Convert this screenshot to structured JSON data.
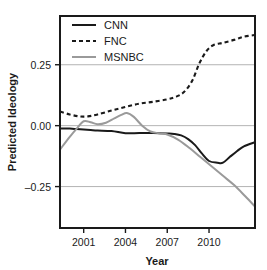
{
  "chart_data": {
    "type": "line",
    "title": "",
    "xlabel": "Year",
    "ylabel": "Predicted Ideology",
    "xlim": [
      1999.3,
      2013.3
    ],
    "ylim": [
      -0.42,
      0.45
    ],
    "xticks": [
      2001,
      2004,
      2007,
      2010
    ],
    "xtick_labels": [
      "2001",
      "2004",
      "2007",
      "2010"
    ],
    "yticks": [
      0.25,
      0.0,
      -0.25
    ],
    "ytick_labels": [
      "0.25",
      "0.00",
      "–0.25"
    ],
    "grid": "horizontal",
    "legend_position": "top-left",
    "series": [
      {
        "name": "CNN",
        "style": "solid",
        "color": "#1a1a1a",
        "x": [
          1999.3,
          2000.0,
          2000.5,
          2001.0,
          2001.5,
          2002.0,
          2003.0,
          2004.0,
          2005.0,
          2006.0,
          2007.0,
          2007.5,
          2008.0,
          2008.5,
          2009.0,
          2009.5,
          2010.0,
          2010.6,
          2011.0,
          2011.5,
          2012.0,
          2012.5,
          2013.3
        ],
        "values": [
          -0.012,
          -0.012,
          -0.014,
          -0.016,
          -0.018,
          -0.02,
          -0.022,
          -0.031,
          -0.03,
          -0.03,
          -0.032,
          -0.034,
          -0.04,
          -0.055,
          -0.08,
          -0.115,
          -0.145,
          -0.152,
          -0.152,
          -0.128,
          -0.105,
          -0.085,
          -0.068
        ]
      },
      {
        "name": "FNC",
        "style": "dashed",
        "color": "#1a1a1a",
        "x": [
          1999.3,
          2000.0,
          2000.7,
          2001.3,
          2002.0,
          2003.0,
          2004.0,
          2005.0,
          2006.0,
          2007.0,
          2007.6,
          2008.2,
          2008.8,
          2009.3,
          2009.8,
          2010.3,
          2011.0,
          2011.8,
          2012.5,
          2013.3
        ],
        "values": [
          0.058,
          0.046,
          0.038,
          0.038,
          0.046,
          0.062,
          0.077,
          0.09,
          0.098,
          0.108,
          0.118,
          0.138,
          0.185,
          0.255,
          0.305,
          0.33,
          0.34,
          0.352,
          0.365,
          0.372
        ]
      },
      {
        "name": "MSNBC",
        "style": "solid",
        "color": "#9a9a9a",
        "x": [
          1999.3,
          2000.0,
          2000.5,
          2001.0,
          2001.5,
          2002.0,
          2002.6,
          2003.2,
          2003.7,
          2004.1,
          2004.6,
          2005.2,
          2005.8,
          2006.4,
          2007.0,
          2007.8,
          2008.6,
          2009.4,
          2010.2,
          2011.0,
          2011.8,
          2012.6,
          2013.3
        ],
        "values": [
          -0.098,
          -0.046,
          -0.012,
          0.018,
          0.014,
          0.006,
          0.012,
          0.03,
          0.044,
          0.052,
          0.036,
          0.0,
          -0.024,
          -0.031,
          -0.036,
          -0.058,
          -0.092,
          -0.13,
          -0.168,
          -0.206,
          -0.244,
          -0.29,
          -0.332
        ]
      }
    ],
    "legend": [
      {
        "label": "CNN",
        "style": "solid",
        "color": "#1a1a1a"
      },
      {
        "label": "FNC",
        "style": "dashed",
        "color": "#1a1a1a"
      },
      {
        "label": "MSNBC",
        "style": "solid",
        "color": "#9a9a9a"
      }
    ]
  },
  "axes": {
    "frame_color": "#1a1a1a",
    "grid_color": "#b4b4b4"
  }
}
